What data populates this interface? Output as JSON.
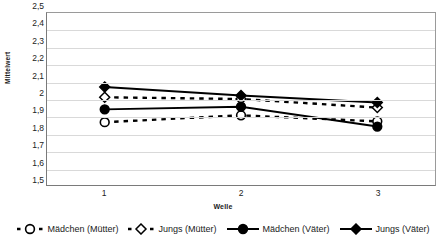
{
  "chart_data": {
    "type": "line",
    "title": "",
    "xlabel": "Welle",
    "ylabel": "Mittelwert",
    "categories": [
      "1",
      "2",
      "3"
    ],
    "x": [
      1,
      2,
      3
    ],
    "xlim": [
      1,
      3
    ],
    "ylim": [
      1.5,
      2.5
    ],
    "y_ticks": [
      "2,5",
      "2,4",
      "2,3",
      "2,2",
      "2,1",
      "2",
      "1,9",
      "1,8",
      "1,7",
      "1,6",
      "1,5"
    ],
    "y_tick_values": [
      2.5,
      2.4,
      2.3,
      2.2,
      2.1,
      2.0,
      1.9,
      1.8,
      1.7,
      1.6,
      1.5
    ],
    "x_tick_labels": [
      "1",
      "2",
      "3"
    ],
    "grid": "horizontal",
    "legend_position": "bottom",
    "series": [
      {
        "name": "Mädchen (Mütter)",
        "values": [
          1.865,
          1.905,
          1.87
        ],
        "marker": "open-circle",
        "line_style": "dashed",
        "color": "#000000"
      },
      {
        "name": "Jungs (Mütter)",
        "values": [
          2.01,
          2.0,
          1.95
        ],
        "marker": "open-diamond",
        "line_style": "dashed",
        "color": "#000000"
      },
      {
        "name": "Mädchen (Väter)",
        "values": [
          1.94,
          1.955,
          1.84
        ],
        "marker": "filled-circle",
        "line_style": "solid",
        "color": "#000000"
      },
      {
        "name": "Jungs (Väter)",
        "values": [
          2.07,
          2.02,
          1.98
        ],
        "marker": "filled-diamond",
        "line_style": "solid",
        "color": "#000000"
      }
    ]
  }
}
